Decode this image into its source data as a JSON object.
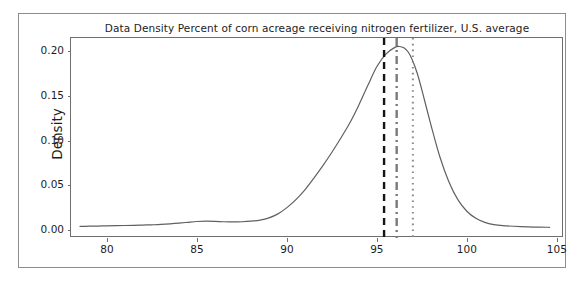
{
  "chart_data": {
    "type": "line",
    "title": "Data Density Percent of corn acreage receiving nitrogen fertilizer, U.S. average",
    "xlabel": "",
    "ylabel": "Density",
    "xlim": [
      78.0,
      105.4
    ],
    "ylim": [
      -0.009,
      0.215
    ],
    "grid": false,
    "legend": false,
    "xticks": [
      80,
      85,
      90,
      95,
      100,
      105
    ],
    "xtick_labels": [
      "80",
      "85",
      "90",
      "95",
      "100",
      "105"
    ],
    "yticks": [
      0.0,
      0.05,
      0.1,
      0.15,
      0.2
    ],
    "ytick_labels": [
      "0.00",
      "0.05",
      "0.10",
      "0.15",
      "0.20"
    ],
    "series": [
      {
        "name": "density",
        "color": "#606060",
        "linewidth": 1.2,
        "x": [
          78.5,
          79.0,
          79.5,
          80.0,
          80.5,
          81.0,
          81.5,
          82.0,
          82.5,
          83.0,
          83.5,
          84.0,
          84.5,
          85.0,
          85.5,
          86.0,
          86.5,
          87.0,
          87.5,
          88.0,
          88.5,
          89.0,
          89.5,
          90.0,
          90.5,
          91.0,
          91.5,
          92.0,
          92.5,
          93.0,
          93.5,
          94.0,
          94.5,
          95.0,
          95.5,
          96.0,
          96.25,
          96.5,
          96.75,
          97.0,
          97.25,
          97.5,
          98.0,
          98.5,
          99.0,
          99.5,
          100.0,
          100.5,
          101.0,
          101.5,
          102.0,
          103.0,
          104.0,
          104.6
        ],
        "y": [
          0.004,
          0.0042,
          0.0044,
          0.0046,
          0.0048,
          0.005,
          0.0052,
          0.0055,
          0.0058,
          0.0062,
          0.0068,
          0.0076,
          0.0086,
          0.0095,
          0.0098,
          0.0096,
          0.0092,
          0.009,
          0.0092,
          0.0098,
          0.011,
          0.0135,
          0.018,
          0.025,
          0.034,
          0.045,
          0.058,
          0.072,
          0.087,
          0.103,
          0.12,
          0.14,
          0.162,
          0.183,
          0.197,
          0.2045,
          0.2055,
          0.204,
          0.199,
          0.189,
          0.175,
          0.157,
          0.118,
          0.082,
          0.054,
          0.034,
          0.021,
          0.013,
          0.0085,
          0.006,
          0.0048,
          0.0038,
          0.0032,
          0.003
        ]
      }
    ],
    "vertical_lines": [
      {
        "name": "black-dashed-reference-line",
        "x": 95.4,
        "color": "#141414",
        "style": "dashed",
        "width": 2.4
      },
      {
        "name": "gray-dashdot-reference-line",
        "x": 96.1,
        "color": "#7a7a7a",
        "style": "dashdot",
        "width": 2.4
      },
      {
        "name": "gray-dotted-reference-line",
        "x": 97.0,
        "color": "#8a8a8a",
        "style": "dotted",
        "width": 2.0
      }
    ]
  }
}
